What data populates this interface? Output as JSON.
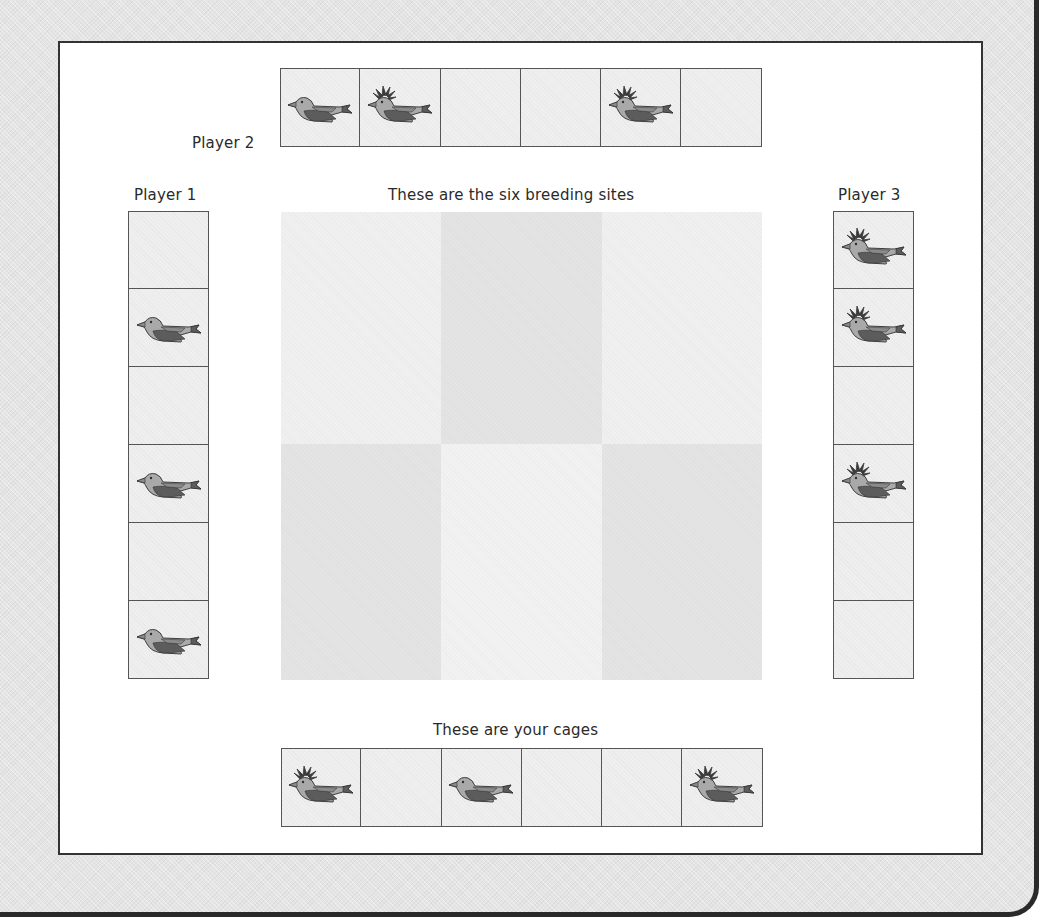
{
  "board": {
    "player2": {
      "label": "Player 2",
      "cages": [
        "plain",
        "crested",
        "empty",
        "empty",
        "crested",
        "empty"
      ]
    },
    "player1": {
      "label": "Player 1",
      "cages": [
        "empty",
        "plain",
        "empty",
        "plain",
        "empty",
        "plain"
      ]
    },
    "player3": {
      "label": "Player 3",
      "cages": [
        "crested",
        "crested",
        "empty",
        "crested",
        "empty",
        "empty"
      ]
    },
    "breeding_sites": {
      "label": "These are the six breeding sites",
      "sites": [
        {
          "shade": "#f0f0f0"
        },
        {
          "shade": "#e4e4e4"
        },
        {
          "shade": "#f0f0f0"
        },
        {
          "shade": "#e4e4e4"
        },
        {
          "shade": "#f2f2f2"
        },
        {
          "shade": "#e4e4e4"
        }
      ]
    },
    "your_cages": {
      "label": "These are your cages",
      "cages": [
        "crested",
        "empty",
        "plain",
        "empty",
        "empty",
        "crested"
      ]
    }
  },
  "colors": {
    "bird_body": "#a9a9a9",
    "bird_wing": "#5c5c5c",
    "bird_mid": "#8a8a8a",
    "bird_outline": "#2f2f2f",
    "crest": "#3a3a3a"
  }
}
